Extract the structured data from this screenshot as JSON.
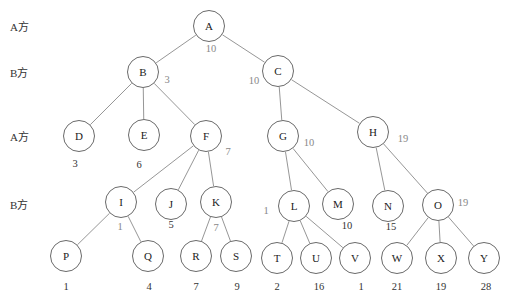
{
  "players": [
    {
      "label": "A方",
      "y": 26
    },
    {
      "label": "B方",
      "y": 72
    },
    {
      "label": "A方",
      "y": 136
    },
    {
      "label": "B方",
      "y": 204
    }
  ],
  "nodes": [
    {
      "id": "A",
      "x": 209,
      "y": 26
    },
    {
      "id": "B",
      "x": 143,
      "y": 72
    },
    {
      "id": "C",
      "x": 278,
      "y": 71
    },
    {
      "id": "D",
      "x": 79,
      "y": 136
    },
    {
      "id": "E",
      "x": 144,
      "y": 135
    },
    {
      "id": "F",
      "x": 206,
      "y": 136
    },
    {
      "id": "G",
      "x": 283,
      "y": 136
    },
    {
      "id": "H",
      "x": 373,
      "y": 132
    },
    {
      "id": "I",
      "x": 121,
      "y": 202
    },
    {
      "id": "J",
      "x": 171,
      "y": 204
    },
    {
      "id": "K",
      "x": 216,
      "y": 202
    },
    {
      "id": "L",
      "x": 294,
      "y": 206
    },
    {
      "id": "M",
      "x": 338,
      "y": 204
    },
    {
      "id": "N",
      "x": 388,
      "y": 206
    },
    {
      "id": "O",
      "x": 438,
      "y": 205
    },
    {
      "id": "P",
      "x": 66,
      "y": 256
    },
    {
      "id": "Q",
      "x": 148,
      "y": 256
    },
    {
      "id": "R",
      "x": 196,
      "y": 256
    },
    {
      "id": "S",
      "x": 236,
      "y": 256
    },
    {
      "id": "T",
      "x": 277,
      "y": 258
    },
    {
      "id": "U",
      "x": 316,
      "y": 258
    },
    {
      "id": "V",
      "x": 355,
      "y": 258
    },
    {
      "id": "W",
      "x": 397,
      "y": 258
    },
    {
      "id": "X",
      "x": 441,
      "y": 258
    },
    {
      "id": "Y",
      "x": 484,
      "y": 258
    }
  ],
  "edges": [
    [
      "A",
      "B"
    ],
    [
      "A",
      "C"
    ],
    [
      "B",
      "D"
    ],
    [
      "B",
      "E"
    ],
    [
      "B",
      "F"
    ],
    [
      "C",
      "G"
    ],
    [
      "C",
      "H"
    ],
    [
      "F",
      "I"
    ],
    [
      "F",
      "J"
    ],
    [
      "F",
      "K"
    ],
    [
      "G",
      "L"
    ],
    [
      "G",
      "M"
    ],
    [
      "H",
      "N"
    ],
    [
      "H",
      "O"
    ],
    [
      "I",
      "P"
    ],
    [
      "I",
      "Q"
    ],
    [
      "K",
      "R"
    ],
    [
      "K",
      "S"
    ],
    [
      "L",
      "T"
    ],
    [
      "L",
      "U"
    ],
    [
      "L",
      "V"
    ],
    [
      "O",
      "W"
    ],
    [
      "O",
      "X"
    ],
    [
      "O",
      "Y"
    ]
  ],
  "values": [
    {
      "node": "A",
      "text": "10",
      "x": 211,
      "y": 48,
      "backed_up": true
    },
    {
      "node": "B",
      "text": "3",
      "x": 167,
      "y": 79,
      "backed_up": true
    },
    {
      "node": "C",
      "text": "10",
      "x": 254,
      "y": 80,
      "backed_up": true
    },
    {
      "node": "D",
      "text": "3",
      "x": 75,
      "y": 163,
      "backed_up": false
    },
    {
      "node": "E",
      "text": "6",
      "x": 139,
      "y": 164,
      "backed_up": false
    },
    {
      "node": "F",
      "text": "7",
      "x": 228,
      "y": 151,
      "backed_up": true
    },
    {
      "node": "G",
      "text": "10",
      "x": 309,
      "y": 142,
      "backed_up": true
    },
    {
      "node": "H",
      "text": "19",
      "x": 403,
      "y": 138,
      "backed_up": true
    },
    {
      "node": "I",
      "text": "1",
      "x": 120,
      "y": 226,
      "backed_up": true
    },
    {
      "node": "J",
      "text": "5",
      "x": 171,
      "y": 224,
      "backed_up": false
    },
    {
      "node": "K",
      "text": "7",
      "x": 216,
      "y": 227,
      "backed_up": true
    },
    {
      "node": "L",
      "text": "1",
      "x": 266,
      "y": 210,
      "backed_up": true
    },
    {
      "node": "M",
      "text": "10",
      "x": 347,
      "y": 225,
      "backed_up": false
    },
    {
      "node": "N",
      "text": "15",
      "x": 391,
      "y": 226,
      "backed_up": false
    },
    {
      "node": "O",
      "text": "19",
      "x": 463,
      "y": 202,
      "backed_up": true
    },
    {
      "node": "P",
      "text": "1",
      "x": 66,
      "y": 286,
      "backed_up": false
    },
    {
      "node": "Q",
      "text": "4",
      "x": 149,
      "y": 286,
      "backed_up": false
    },
    {
      "node": "R",
      "text": "7",
      "x": 196,
      "y": 286,
      "backed_up": false
    },
    {
      "node": "S",
      "text": "9",
      "x": 237,
      "y": 286,
      "backed_up": false
    },
    {
      "node": "T",
      "text": "2",
      "x": 277,
      "y": 286,
      "backed_up": false
    },
    {
      "node": "U",
      "text": "16",
      "x": 319,
      "y": 286,
      "backed_up": false
    },
    {
      "node": "V",
      "text": "1",
      "x": 361,
      "y": 286,
      "backed_up": false
    },
    {
      "node": "W",
      "text": "21",
      "x": 397,
      "y": 286,
      "backed_up": false
    },
    {
      "node": "X",
      "text": "19",
      "x": 441,
      "y": 286,
      "backed_up": false
    },
    {
      "node": "Y",
      "text": "28",
      "x": 486,
      "y": 286,
      "backed_up": false
    }
  ]
}
